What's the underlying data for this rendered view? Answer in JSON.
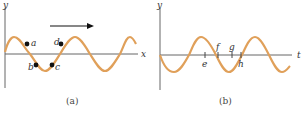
{
  "colors": {
    "wave": "#e0a05a",
    "axis": "#666666",
    "dot": "#111111",
    "arrow": "#111111",
    "text": "#333333"
  },
  "panel_a": {
    "caption": "(a)",
    "y_label": "y",
    "x_label": "x",
    "arrow_direction": "right",
    "points": [
      {
        "label": "a",
        "x": 27,
        "y": 44
      },
      {
        "label": "b",
        "x": 36,
        "y": 65
      },
      {
        "label": "c",
        "x": 52,
        "y": 65
      },
      {
        "label": "d",
        "x": 61,
        "y": 44
      }
    ]
  },
  "panel_b": {
    "caption": "(b)",
    "y_label": "y",
    "x_label": "t",
    "ticks": [
      {
        "label": "e",
        "x": 205,
        "label_pos": "below"
      },
      {
        "label": "f",
        "x": 218,
        "label_pos": "above"
      },
      {
        "label": "g",
        "x": 232,
        "label_pos": "above"
      },
      {
        "label": "h",
        "x": 241,
        "label_pos": "below"
      }
    ]
  }
}
